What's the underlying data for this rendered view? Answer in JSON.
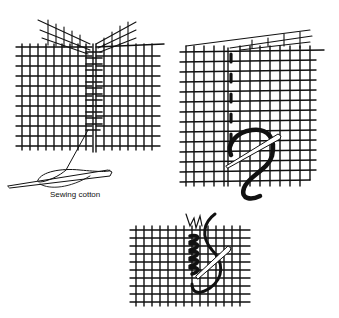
{
  "figures": [
    {
      "id": "fig-ladder-stitch-seam",
      "label": "Sewing cotton"
    },
    {
      "id": "fig-running-stitch"
    },
    {
      "id": "fig-overcast-stitch"
    }
  ],
  "colors": {
    "ink": "#111111",
    "background": "#ffffff"
  }
}
